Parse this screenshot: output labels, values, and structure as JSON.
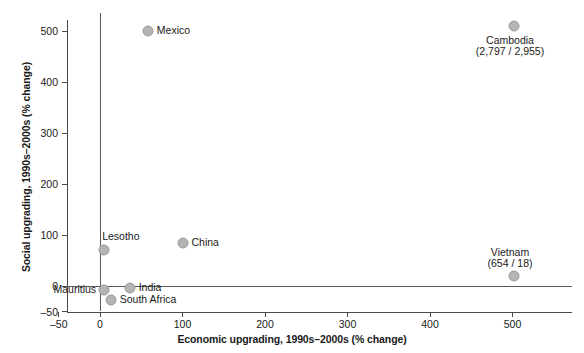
{
  "chart_data": {
    "type": "scatter",
    "title": "",
    "xlabel": "Economic upgrading, 1990s–2000s (% change)",
    "ylabel": "Social upgrading, 1990s–2000s (% change)",
    "xlim": [
      -60,
      550
    ],
    "ylim": [
      -55,
      525
    ],
    "grid": false,
    "legend": "none",
    "xticks": [
      "–50",
      "0",
      "100",
      "200",
      "300",
      "400",
      "500"
    ],
    "xtick_values": [
      -50,
      0,
      100,
      200,
      300,
      400,
      500
    ],
    "yticks": [
      "–50",
      "0",
      "100",
      "200",
      "300",
      "400",
      "500"
    ],
    "ytick_values": [
      -50,
      0,
      100,
      200,
      300,
      400,
      500
    ],
    "reference_lines": {
      "x": 0,
      "y": 0
    },
    "points": [
      {
        "name": "Mexico",
        "x": 58,
        "y": 500,
        "label": "Mexico",
        "label_pos": "right"
      },
      {
        "name": "Cambodia",
        "x": 502,
        "y": 510,
        "label": "Cambodia\n(2,797 / 2,955)",
        "label_pos": "below-center",
        "note": "off-scale: 2,797 economic / 2,955 social"
      },
      {
        "name": "Vietnam",
        "x": 502,
        "y": 20,
        "label": "Vietnam\n(654 / 18)",
        "label_pos": "above-center",
        "note": "off-scale: 654 economic / 18 social"
      },
      {
        "name": "China",
        "x": 100,
        "y": 84,
        "label": "China",
        "label_pos": "right"
      },
      {
        "name": "Lesotho",
        "x": 5,
        "y": 70,
        "label": "Lesotho",
        "label_pos": "above-right"
      },
      {
        "name": "India",
        "x": 36,
        "y": -4,
        "label": "India",
        "label_pos": "right"
      },
      {
        "name": "Mauritius",
        "x": 5,
        "y": -8,
        "label": "Mauritius",
        "label_pos": "left"
      },
      {
        "name": "South Africa",
        "x": 13,
        "y": -27,
        "label": "South Africa",
        "label_pos": "right"
      }
    ],
    "colors": {
      "marker_fill": "#b4b4b4",
      "marker_edge": "#9a9a9a",
      "axis": "#4a4a4a",
      "reference_line": "#5a5a5a",
      "text": "#1a1a1a",
      "background": "#ffffff"
    }
  }
}
